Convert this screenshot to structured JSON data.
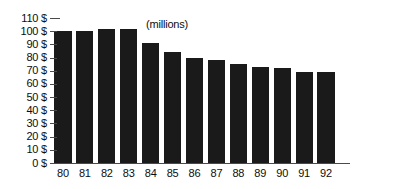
{
  "chart_data": {
    "type": "bar",
    "title": "",
    "subtitle": "",
    "xlabel": "",
    "ylabel": "$",
    "annotation": "(millions)",
    "categories": [
      "80",
      "81",
      "82",
      "83",
      "84",
      "85",
      "86",
      "87",
      "88",
      "89",
      "90",
      "91",
      "92"
    ],
    "values": [
      100,
      100,
      102,
      102,
      91,
      84,
      80,
      78,
      75,
      73,
      72,
      69,
      69
    ],
    "ylim": [
      0,
      110
    ],
    "ytick_values": [
      110,
      100,
      90,
      80,
      70,
      60,
      50,
      40,
      30,
      20,
      10,
      0
    ],
    "ytick_labels": [
      "110 $",
      "100 $",
      "90 $",
      "80 $",
      "70 $",
      "60 $",
      "50 $",
      "40 $",
      "30 $",
      "20 $",
      "10 $",
      "0 $"
    ],
    "grid": false,
    "legend": "none",
    "bar_color": "#1a1a1a",
    "axis_color": "#4a4a4a",
    "text_color": "#0d0d0d",
    "background_color": "#ffffff"
  }
}
